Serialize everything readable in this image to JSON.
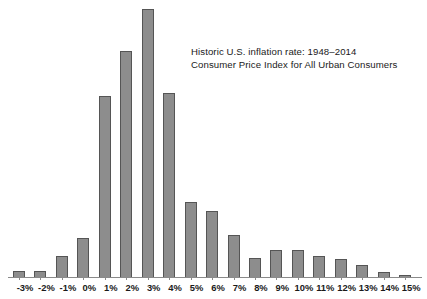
{
  "chart_data": {
    "type": "bar",
    "title": "Historic U.S. inflation rate: 1948–2014",
    "subtitle": "Consumer Price Index for All Urban Consumers",
    "annotation_lines": [
      "Historic U.S. inflation rate: 1948–2014",
      "Consumer Price Index for All Urban Consumers"
    ],
    "xlabel": "",
    "ylabel": "",
    "grid": false,
    "legend": false,
    "categories": [
      "-3%",
      "-2%",
      "-1%",
      "0%",
      "1%",
      "2%",
      "3%",
      "4%",
      "5%",
      "6%",
      "7%",
      "8%",
      "9%",
      "10%",
      "11%",
      "12%",
      "13%",
      "14%",
      "15%"
    ],
    "values": [
      7,
      7,
      22,
      40,
      184,
      229,
      272,
      187,
      77,
      68,
      43,
      20,
      28,
      28,
      22,
      19,
      13,
      6,
      3
    ],
    "ylim": [
      0,
      275
    ],
    "bar_color": "#8d8d8d",
    "bar_edge_color": "#555555",
    "axis_color": "#8a8a8a",
    "text_color": "#1a1a1a",
    "background": "#ffffff"
  }
}
